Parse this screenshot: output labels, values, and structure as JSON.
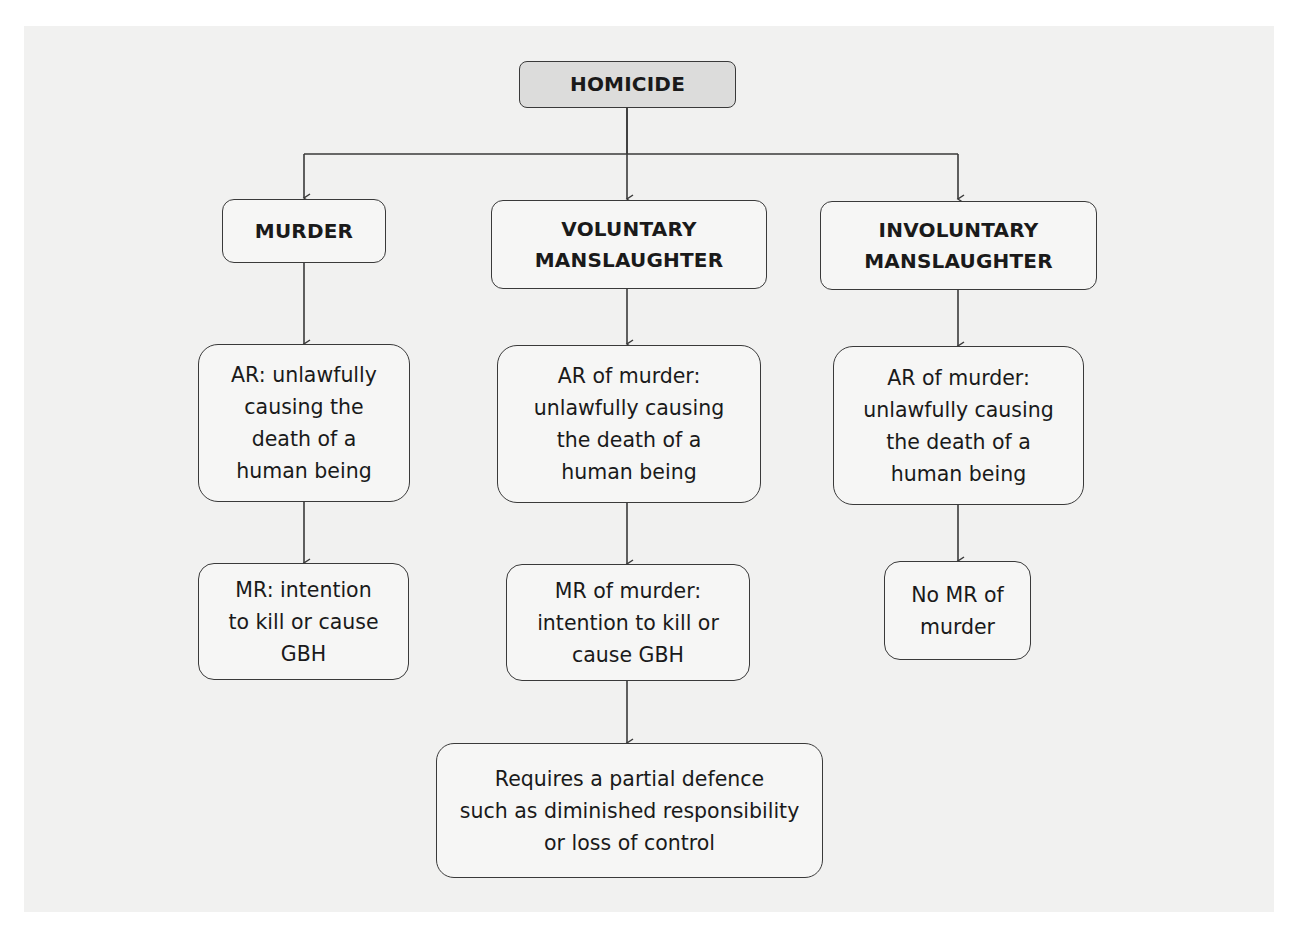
{
  "diagram": {
    "type": "flowchart",
    "colors": {
      "background": "#f1f1f0",
      "root_fill": "#dcdcdb",
      "node_fill": "#f6f6f5",
      "stroke": "#3a3a3a"
    },
    "root": {
      "label": "HOMICIDE"
    },
    "branches": [
      {
        "label": "MURDER",
        "ar": "AR: unlawfully\ncausing the\ndeath of a\nhuman being",
        "mr": "MR: intention\nto kill or cause\nGBH"
      },
      {
        "label": "VOLUNTARY\nMANSLAUGHTER",
        "ar": "AR of murder:\nunlawfully causing\nthe death of a\nhuman being",
        "mr": "MR of murder:\nintention to kill or\ncause GBH",
        "extra": "Requires a partial defence\nsuch as diminished responsibility\nor loss of control"
      },
      {
        "label": "INVOLUNTARY\nMANSLAUGHTER",
        "ar": "AR of murder:\nunlawfully causing\nthe death of a\nhuman being",
        "mr": "No MR of\nmurder"
      }
    ],
    "edges": [
      [
        "HOMICIDE",
        "MURDER"
      ],
      [
        "HOMICIDE",
        "VOLUNTARY MANSLAUGHTER"
      ],
      [
        "HOMICIDE",
        "INVOLUNTARY MANSLAUGHTER"
      ],
      [
        "MURDER",
        "AR (murder)"
      ],
      [
        "AR (murder)",
        "MR (murder)"
      ],
      [
        "VOLUNTARY MANSLAUGHTER",
        "AR of murder (voluntary)"
      ],
      [
        "AR of murder (voluntary)",
        "MR of murder (voluntary)"
      ],
      [
        "MR of murder (voluntary)",
        "Requires a partial defence"
      ],
      [
        "INVOLUNTARY MANSLAUGHTER",
        "AR of murder (involuntary)"
      ],
      [
        "AR of murder (involuntary)",
        "No MR of murder"
      ]
    ]
  }
}
